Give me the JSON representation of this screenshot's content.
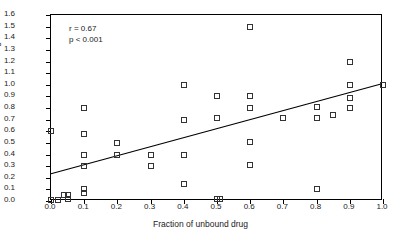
{
  "chart_data": {
    "type": "scatter",
    "title": "",
    "xlabel": "Fraction of unbound drug",
    "ylabel": "Sieving coefficient",
    "xlim": [
      0.0,
      1.0
    ],
    "ylim": [
      0.0,
      1.6
    ],
    "grid": false,
    "legend": "none",
    "xticks": [
      "0.0",
      "0.1",
      "0.2",
      "0.3",
      "0.4",
      "0.5",
      "0.6",
      "0.7",
      "0.8",
      "0.9",
      "1.0"
    ],
    "xtick_values": [
      0.0,
      0.1,
      0.2,
      0.3,
      0.4,
      0.5,
      0.6,
      0.7,
      0.8,
      0.9,
      1.0
    ],
    "yticks": [
      "0.0",
      "0.1",
      "0.2",
      "0.3",
      "0.4",
      "0.5",
      "0.6",
      "0.7",
      "0.8",
      "0.9",
      "1.0",
      "1.1",
      "1.2",
      "1.3",
      "1.4",
      "1.5",
      "1.6"
    ],
    "ytick_values": [
      0.0,
      0.1,
      0.2,
      0.3,
      0.4,
      0.5,
      0.6,
      0.7,
      0.8,
      0.9,
      1.0,
      1.1,
      1.2,
      1.3,
      1.4,
      1.5,
      1.6
    ],
    "marker": "open-square",
    "points": [
      {
        "x": 0.0,
        "y": 0.6
      },
      {
        "x": 0.0,
        "y": 0.01
      },
      {
        "x": 0.02,
        "y": 0.01
      },
      {
        "x": 0.04,
        "y": 0.05
      },
      {
        "x": 0.05,
        "y": 0.05
      },
      {
        "x": 0.05,
        "y": 0.02
      },
      {
        "x": 0.1,
        "y": 0.8
      },
      {
        "x": 0.1,
        "y": 0.58
      },
      {
        "x": 0.1,
        "y": 0.4
      },
      {
        "x": 0.1,
        "y": 0.3
      },
      {
        "x": 0.1,
        "y": 0.1
      },
      {
        "x": 0.1,
        "y": 0.07
      },
      {
        "x": 0.2,
        "y": 0.5
      },
      {
        "x": 0.2,
        "y": 0.4
      },
      {
        "x": 0.3,
        "y": 0.4
      },
      {
        "x": 0.3,
        "y": 0.3
      },
      {
        "x": 0.4,
        "y": 1.0
      },
      {
        "x": 0.4,
        "y": 0.7
      },
      {
        "x": 0.4,
        "y": 0.4
      },
      {
        "x": 0.4,
        "y": 0.15
      },
      {
        "x": 0.5,
        "y": 0.9
      },
      {
        "x": 0.5,
        "y": 0.71
      },
      {
        "x": 0.5,
        "y": 0.02
      },
      {
        "x": 0.51,
        "y": 0.02
      },
      {
        "x": 0.6,
        "y": 1.5
      },
      {
        "x": 0.6,
        "y": 0.9
      },
      {
        "x": 0.6,
        "y": 0.8
      },
      {
        "x": 0.6,
        "y": 0.51
      },
      {
        "x": 0.6,
        "y": 0.31
      },
      {
        "x": 0.7,
        "y": 0.71
      },
      {
        "x": 0.8,
        "y": 0.81
      },
      {
        "x": 0.8,
        "y": 0.71
      },
      {
        "x": 0.8,
        "y": 0.1
      },
      {
        "x": 0.85,
        "y": 0.74
      },
      {
        "x": 0.9,
        "y": 1.2
      },
      {
        "x": 0.9,
        "y": 1.0
      },
      {
        "x": 0.9,
        "y": 0.89
      },
      {
        "x": 0.9,
        "y": 0.8
      },
      {
        "x": 1.0,
        "y": 1.0
      }
    ],
    "fit_line": {
      "type": "linear-regression",
      "x_start": 0.0,
      "y_start": 0.22,
      "x_end": 1.0,
      "y_end": 1.0
    },
    "annotations": {
      "correlation": "r = 0.67",
      "p_value": "p < 0.001"
    }
  }
}
